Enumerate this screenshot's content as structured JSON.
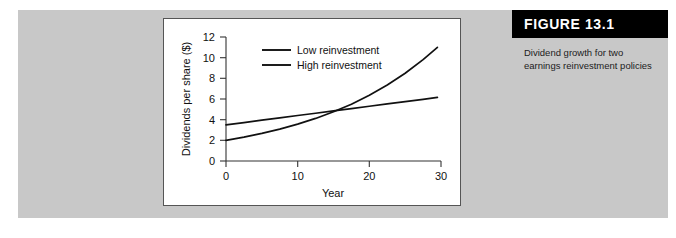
{
  "figure": {
    "number_label": "FIGURE 13.1",
    "caption_line1": "Dividend growth for two",
    "caption_line2": "earnings reinvestment policies",
    "caption_full": "Dividend growth for two earnings reinvestment policies",
    "header_bar_color": "#000000",
    "panel_background_color": "#c8c8c8",
    "plot_background_color": "#ffffff"
  },
  "chart_data": {
    "type": "line",
    "title": "",
    "subtitle": "",
    "xlabel": "Year",
    "ylabel": "Dividends per share ($)",
    "xlim": [
      0,
      30
    ],
    "ylim": [
      0,
      12
    ],
    "xticks": [
      0,
      10,
      20,
      30
    ],
    "xticklabels": [
      "0",
      "10",
      "20",
      "30"
    ],
    "yticks": [
      0,
      2,
      4,
      6,
      8,
      10,
      12
    ],
    "yticklabels": [
      "0",
      "2",
      "4",
      "6",
      "8",
      "10",
      "12"
    ],
    "grid": false,
    "legend_position": "upper-center",
    "line_color": "#111111",
    "x": [
      0,
      2.5,
      5,
      7.5,
      10,
      12.5,
      15,
      17.5,
      20,
      22.5,
      25,
      27.5,
      29.5
    ],
    "series": [
      {
        "name": "Low reinvestment",
        "style": "linear",
        "start_value": 3.5,
        "end_value": 6.2,
        "growth_rate_pct": 1.93,
        "values": [
          3.5,
          3.72,
          3.95,
          4.17,
          4.4,
          4.62,
          4.85,
          5.07,
          5.3,
          5.52,
          5.75,
          5.97,
          6.15
        ]
      },
      {
        "name": "High reinvestment",
        "style": "exponential",
        "start_value": 2.0,
        "end_value": 11.0,
        "growth_rate_pct": 5.93,
        "values": [
          2.0,
          2.31,
          2.67,
          3.09,
          3.57,
          4.12,
          4.76,
          5.5,
          6.36,
          7.35,
          8.49,
          9.81,
          11.0
        ]
      }
    ],
    "crossover": {
      "year": 13.5,
      "value": 4.55
    },
    "legend_entries": [
      "Low reinvestment",
      "High reinvestment"
    ]
  }
}
